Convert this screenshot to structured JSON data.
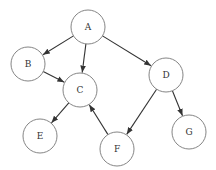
{
  "diagram": {
    "type": "directed-graph",
    "node_radius": 17,
    "colors": {
      "node_stroke": "#777777",
      "edge": "#333333",
      "label": "#333333",
      "background": "#ffffff"
    },
    "nodes": [
      {
        "id": "A",
        "label": "A",
        "x": 88,
        "y": 27
      },
      {
        "id": "B",
        "label": "B",
        "x": 28,
        "y": 64
      },
      {
        "id": "C",
        "label": "C",
        "x": 80,
        "y": 90
      },
      {
        "id": "D",
        "label": "D",
        "x": 166,
        "y": 75
      },
      {
        "id": "E",
        "label": "E",
        "x": 40,
        "y": 136
      },
      {
        "id": "F",
        "label": "F",
        "x": 117,
        "y": 149
      },
      {
        "id": "G",
        "label": "G",
        "x": 189,
        "y": 132
      }
    ],
    "edges": [
      {
        "from": "A",
        "to": "B"
      },
      {
        "from": "A",
        "to": "C"
      },
      {
        "from": "A",
        "to": "D"
      },
      {
        "from": "B",
        "to": "C"
      },
      {
        "from": "C",
        "to": "E"
      },
      {
        "from": "F",
        "to": "C"
      },
      {
        "from": "D",
        "to": "F"
      },
      {
        "from": "D",
        "to": "G"
      }
    ]
  }
}
